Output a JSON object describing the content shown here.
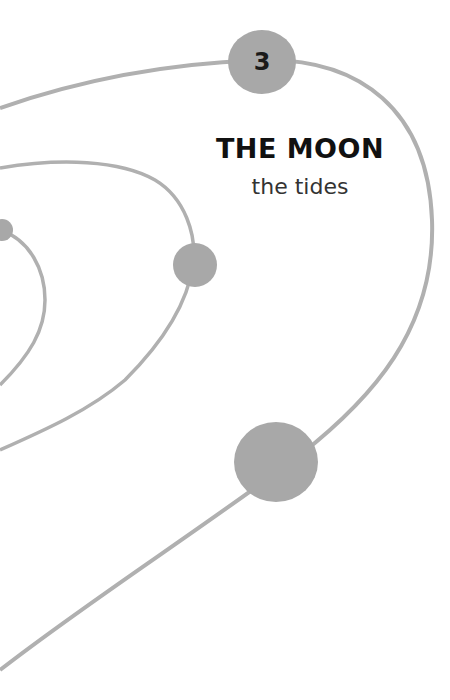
{
  "chapter": {
    "number": "3",
    "title": "THE MOON",
    "subtitle": "the tides"
  },
  "colors": {
    "background": "#ffffff",
    "orbit_line": "#b0b0b0",
    "planet_fill": "#a8a8a8",
    "title_text": "#111111",
    "subtitle_text": "#333333"
  }
}
